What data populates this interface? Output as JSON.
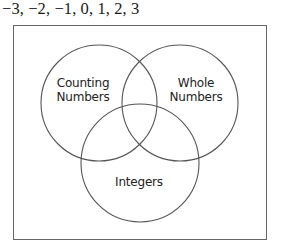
{
  "header": {
    "number_list": "−3, −2, −1, 0, 1, 2, 3"
  },
  "diagram": {
    "type": "venn",
    "line_color": "#555555",
    "sets": [
      {
        "id": "counting",
        "label_line1": "Counting",
        "label_line2": "Numbers",
        "cx": 99,
        "cy": 103,
        "r": 58
      },
      {
        "id": "whole",
        "label_line1": "Whole",
        "label_line2": "Numbers",
        "cx": 180,
        "cy": 103,
        "r": 58
      },
      {
        "id": "integers",
        "label_line1": "Integers",
        "cx": 140,
        "cy": 163,
        "r": 59
      }
    ]
  }
}
